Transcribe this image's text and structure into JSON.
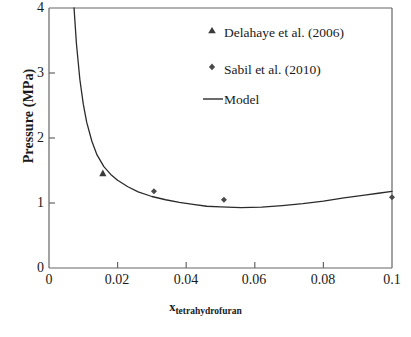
{
  "chart_data": {
    "type": "scatter",
    "title": "",
    "xlabel": "x_tetrahydrofuran",
    "xlabel_symbol": "x",
    "xlabel_subscript": "tetrahydrofuran",
    "ylabel": "Pressure (MPa)",
    "xlim": [
      0,
      0.1
    ],
    "ylim": [
      0,
      4
    ],
    "xticks": [
      "0",
      "0.02",
      "0.04",
      "0.06",
      "0.08",
      "0.1"
    ],
    "xtick_values": [
      0,
      0.02,
      0.04,
      0.06,
      0.08,
      0.1
    ],
    "yticks": [
      "0",
      "1",
      "2",
      "3",
      "4"
    ],
    "ytick_values": [
      0,
      1,
      2,
      3,
      4
    ],
    "grid": false,
    "legend_position": "top-right",
    "series": [
      {
        "name": "Delahaye et al. (2006)",
        "marker": "triangle",
        "color": "#3a3a3a",
        "points": [
          {
            "x": 0.0157,
            "y": 1.46
          }
        ]
      },
      {
        "name": "Sabil et al. (2010)",
        "marker": "diamond-dot",
        "color": "#4a4a4a",
        "points": [
          {
            "x": 0.0306,
            "y": 1.18
          },
          {
            "x": 0.051,
            "y": 1.05
          },
          {
            "x": 0.1,
            "y": 1.09
          }
        ]
      },
      {
        "name": "Model",
        "marker": "line",
        "color": "#2b2b2b",
        "points": [
          {
            "x": 0.0073,
            "y": 4.0
          },
          {
            "x": 0.008,
            "y": 3.45
          },
          {
            "x": 0.009,
            "y": 2.9
          },
          {
            "x": 0.01,
            "y": 2.52
          },
          {
            "x": 0.011,
            "y": 2.24
          },
          {
            "x": 0.0125,
            "y": 1.95
          },
          {
            "x": 0.014,
            "y": 1.74
          },
          {
            "x": 0.016,
            "y": 1.56
          },
          {
            "x": 0.018,
            "y": 1.44
          },
          {
            "x": 0.02,
            "y": 1.35
          },
          {
            "x": 0.023,
            "y": 1.25
          },
          {
            "x": 0.026,
            "y": 1.17
          },
          {
            "x": 0.03,
            "y": 1.1
          },
          {
            "x": 0.034,
            "y": 1.05
          },
          {
            "x": 0.038,
            "y": 1.01
          },
          {
            "x": 0.042,
            "y": 0.98
          },
          {
            "x": 0.046,
            "y": 0.95
          },
          {
            "x": 0.05,
            "y": 0.94
          },
          {
            "x": 0.056,
            "y": 0.93
          },
          {
            "x": 0.062,
            "y": 0.935
          },
          {
            "x": 0.068,
            "y": 0.96
          },
          {
            "x": 0.074,
            "y": 0.99
          },
          {
            "x": 0.08,
            "y": 1.03
          },
          {
            "x": 0.086,
            "y": 1.08
          },
          {
            "x": 0.092,
            "y": 1.12
          },
          {
            "x": 0.096,
            "y": 1.15
          },
          {
            "x": 0.1,
            "y": 1.18
          }
        ]
      }
    ],
    "legend": [
      {
        "label": "Delahaye et al. (2006)",
        "marker": "triangle"
      },
      {
        "label": "Sabil et al. (2010)",
        "marker": "diamond-dot"
      },
      {
        "label": "Model",
        "marker": "line"
      }
    ],
    "axis_color": "#555555",
    "curve_color": "#2b2b2b"
  }
}
